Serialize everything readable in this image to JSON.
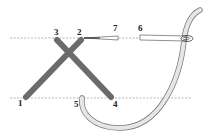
{
  "diagram": {
    "type": "cross-stitch-technique",
    "labels": [
      {
        "id": "1",
        "text": "1",
        "x": 18,
        "y": 106
      },
      {
        "id": "2",
        "text": "2",
        "x": 77,
        "y": 35
      },
      {
        "id": "3",
        "text": "3",
        "x": 54,
        "y": 35
      },
      {
        "id": "4",
        "text": "4",
        "x": 113,
        "y": 107
      },
      {
        "id": "5",
        "text": "5",
        "x": 74,
        "y": 107
      },
      {
        "id": "6",
        "text": "6",
        "x": 138,
        "y": 31
      },
      {
        "id": "7",
        "text": "7",
        "x": 113,
        "y": 31
      }
    ],
    "colors": {
      "stitch": "#6b6b6b",
      "thread_fill": "#e6e6e6",
      "thread_outline": "#777777",
      "guide_line": "#888888",
      "needle": "#555555"
    }
  }
}
